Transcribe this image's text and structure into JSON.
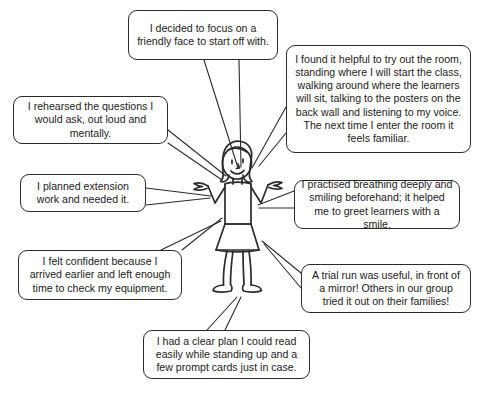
{
  "page": {
    "title": "",
    "background_color": "#ffffff",
    "stroke_color": "#2b2b2b",
    "text_color": "#1b1b1b",
    "width": 489,
    "height": 398
  },
  "figure": {
    "name": "shrugging-teacher-stick-figure"
  },
  "bubbles": [
    {
      "id": "focus-friendly-face",
      "name": "speech-bubble-focus-friendly-face",
      "text": "I decided to focus on a friendly face to start off with.",
      "lines": [
        "I decided to focus on a",
        "friendly face to start off",
        "with."
      ],
      "x": 128,
      "y": 10,
      "w": 150,
      "h": 50
    },
    {
      "id": "try-out-the-room",
      "name": "speech-bubble-try-out-the-room",
      "text": "I found it helpful to try out the room, standing where I will start the class, walking around where the learners will sit, talking to the posters on the back wall and listening to my voice. The next time I enter the room it feels familiar.",
      "lines": [
        "I found it helpful to try out the room,",
        "standing where I will start the class,",
        "walking around where the learners",
        "will sit, talking to the posters on the",
        "back wall and listening to my voice.",
        "The next time I enter the room it feels",
        "familiar."
      ],
      "x": 286,
      "y": 45,
      "w": 185,
      "h": 108
    },
    {
      "id": "rehearsed-questions",
      "name": "speech-bubble-rehearsed-questions",
      "text": "I rehearsed the questions I would ask, out loud and mentally.",
      "lines": [
        "I rehearsed the questions I",
        "would ask, out loud and",
        "mentally."
      ],
      "x": 13,
      "y": 96,
      "w": 155,
      "h": 48
    },
    {
      "id": "planned-extension-work",
      "name": "speech-bubble-planned-extension-work",
      "text": "I planned extension work and needed it.",
      "lines": [
        "I planned extension",
        "work and needed it."
      ],
      "x": 20,
      "y": 174,
      "w": 126,
      "h": 38
    },
    {
      "id": "practised-breathing",
      "name": "speech-bubble-practised-breathing",
      "text": "I practised breathing deeply and smiling beforehand; it helped me to greet learners with a smile.",
      "lines": [
        "I practised breathing deeply and",
        "smiling beforehand; it helped me",
        "to greet learners with a smile."
      ],
      "x": 294,
      "y": 180,
      "w": 166,
      "h": 49
    },
    {
      "id": "felt-confident-arrived-early",
      "name": "speech-bubble-felt-confident-arrived-early",
      "text": "I felt confident because I arrived earlier and left enough time to check my equipment.",
      "lines": [
        "I felt confident because I",
        "arrived earlier and left enough",
        "time to check my equipment."
      ],
      "x": 18,
      "y": 250,
      "w": 164,
      "h": 50
    },
    {
      "id": "trial-run-mirror",
      "name": "speech-bubble-trial-run-mirror",
      "text": "A trial run was useful, in front of a mirror! Others in our group tried it out on their families!",
      "lines": [
        "A trial run was useful, in front of",
        "a mirror! Others in our group tried",
        "it out on their families!"
      ],
      "x": 301,
      "y": 264,
      "w": 170,
      "h": 49
    },
    {
      "id": "clear-plan-prompt-cards",
      "name": "speech-bubble-clear-plan-prompt-cards",
      "text": "I had a clear plan I could read easily while standing up and a few prompt cards just in case.",
      "lines": [
        "I had a clear plan I could read",
        "easily while standing up and a",
        "few prompt cards just in case."
      ],
      "x": 143,
      "y": 330,
      "w": 167,
      "h": 49
    }
  ]
}
